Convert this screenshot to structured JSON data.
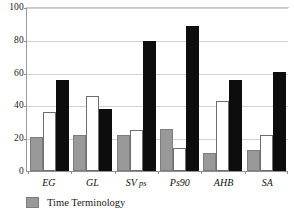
{
  "chart_data": {
    "type": "bar",
    "title": "",
    "xlabel": "",
    "ylabel": "",
    "ylim": [
      0,
      100
    ],
    "yticks": [
      0,
      20,
      40,
      60,
      80,
      100
    ],
    "grid": true,
    "legend_position": "bottom-left",
    "categories": [
      "EG",
      "GL",
      "SV ps",
      "Ps90",
      "AHB",
      "SA"
    ],
    "series": [
      {
        "name": "Time Terminology",
        "color": "#999999",
        "values": [
          21,
          22,
          22,
          26,
          11,
          13
        ]
      },
      {
        "name": "",
        "color": "#ffffff",
        "values": [
          36,
          46,
          25,
          14,
          43,
          22
        ]
      },
      {
        "name": "",
        "color": "#0d0d0d",
        "values": [
          56,
          38,
          80,
          89,
          56,
          61
        ]
      }
    ],
    "legend": [
      {
        "label": "Time Terminology",
        "color": "#999999"
      }
    ]
  }
}
